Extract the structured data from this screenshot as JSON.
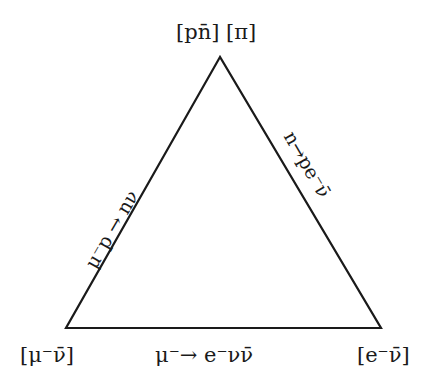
{
  "diagram": {
    "type": "triangle",
    "vertices": {
      "top": "[pn̄]  [π]",
      "left": "[μ⁻ν̄]",
      "right": "[e⁻ν̄]"
    },
    "edges": {
      "left": "μ⁻p → nν",
      "right": "n→pe⁻ν̄",
      "bottom": "μ⁻→ e⁻νν̄"
    },
    "colors": {
      "line": "#1a1a1a",
      "background": "#ffffff"
    }
  }
}
